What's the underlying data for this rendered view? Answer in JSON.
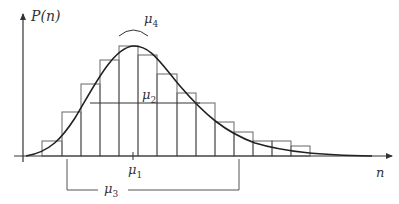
{
  "diagram": {
    "y_axis_label": "P(n)",
    "x_axis_label": "n",
    "labels": {
      "mu1": {
        "base": "μ",
        "sub": "1",
        "meaning": "mean"
      },
      "mu2": {
        "base": "μ",
        "sub": "2",
        "meaning": "variance (width)"
      },
      "mu3": {
        "base": "μ",
        "sub": "3",
        "meaning": "skewness (range bracket)"
      },
      "mu4": {
        "base": "μ",
        "sub": "4",
        "meaning": "kurtosis (peak curvature)"
      }
    },
    "colors": {
      "stroke": "#333333",
      "bar_stroke": "#555555",
      "background": "#ffffff"
    }
  },
  "chart_data": {
    "type": "bar",
    "title": "",
    "xlabel": "n",
    "ylabel": "P(n)",
    "bin_edges_px": [
      42,
      62,
      81,
      100,
      119,
      138,
      157,
      177,
      196,
      215,
      234,
      253,
      272,
      291,
      310
    ],
    "categories": [
      "1",
      "2",
      "3",
      "4",
      "5",
      "6",
      "7",
      "8",
      "9",
      "10",
      "11",
      "12",
      "13",
      "14"
    ],
    "values": [
      15,
      44,
      72,
      96,
      110,
      101,
      82,
      63,
      53,
      34,
      24,
      15,
      15,
      10
    ],
    "overlay": {
      "type": "line",
      "name": "fitted P(n) curve",
      "shape": "right-skewed unimodal"
    },
    "grid": false
  }
}
